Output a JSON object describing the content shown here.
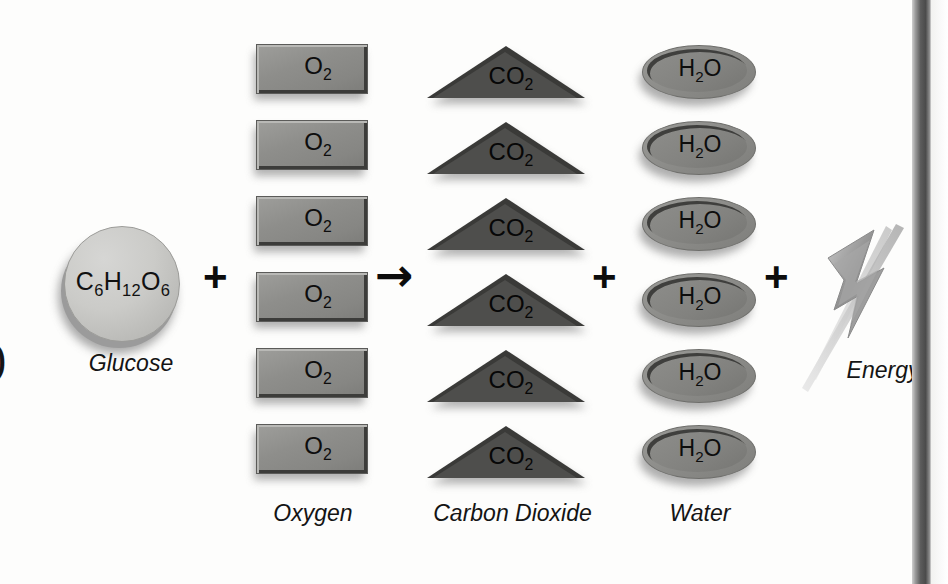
{
  "diagram": {
    "background_color": "#fdfdfc"
  },
  "left_edge": {
    "clipped_glyph": ")"
  },
  "reactants": {
    "glucose": {
      "formula_main": "C",
      "formula_parts": [
        {
          "base": "C",
          "sub": "6"
        },
        {
          "base": "H",
          "sub": "12"
        },
        {
          "base": "O",
          "sub": "6"
        }
      ],
      "caption": "Glucose",
      "shape": "circle",
      "fill_color": "#cbcbc8",
      "count": 1
    },
    "oxygen": {
      "formula": [
        {
          "base": "O",
          "sub": "2"
        }
      ],
      "caption": "Oxygen",
      "shape": "rectangle",
      "fill_color": "#8e8e8b",
      "count": 6,
      "items": [
        "O2",
        "O2",
        "O2",
        "O2",
        "O2",
        "O2"
      ]
    }
  },
  "products": {
    "carbon_dioxide": {
      "formula": [
        {
          "base": "CO",
          "sub": "2"
        }
      ],
      "caption": "Carbon Dioxide",
      "shape": "triangle",
      "fill_color": "#4e4e4c",
      "count": 6,
      "items": [
        "CO2",
        "CO2",
        "CO2",
        "CO2",
        "CO2",
        "CO2"
      ]
    },
    "water": {
      "formula": [
        {
          "base": "H",
          "sub": "2"
        },
        {
          "base": "O",
          "sub": ""
        }
      ],
      "caption": "Water",
      "shape": "ellipse",
      "fill_color": "#82827f",
      "count": 6,
      "items": [
        "H2O",
        "H2O",
        "H2O",
        "H2O",
        "H2O",
        "H2O"
      ]
    },
    "energy": {
      "caption": "Energy",
      "shape": "lightning-bolt",
      "fill_color": "#9b9b9b"
    }
  },
  "operators": {
    "plus_1": "+",
    "arrow": "→",
    "plus_2": "+",
    "plus_3": "+"
  },
  "decor": {
    "right_bar_color": "#4b4b4b"
  }
}
